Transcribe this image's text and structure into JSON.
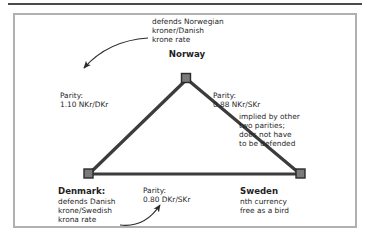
{
  "figure": {
    "type": "currency-parity-triangle",
    "nodes": [
      {
        "id": "norway",
        "label": "Norway",
        "role": "apex",
        "x": 186,
        "y": 78
      },
      {
        "id": "denmark",
        "label": "Denmark:",
        "role": "bottom-left",
        "x": 88,
        "y": 173
      },
      {
        "id": "sweden",
        "label": "Sweden",
        "role": "bottom-right",
        "x": 300,
        "y": 173
      }
    ],
    "edges": [
      {
        "id": "norway-denmark",
        "from": "norway",
        "to": "denmark",
        "parity_label": "Parity:",
        "parity_value": "1.10 NKr/DKr"
      },
      {
        "id": "norway-sweden",
        "from": "norway",
        "to": "sweden",
        "parity_label": "Parity:",
        "parity_value": "0.88 NKr/SKr"
      },
      {
        "id": "denmark-sweden",
        "from": "denmark",
        "to": "sweden",
        "parity_label": "Parity:",
        "parity_value": "0.80 DKr/SKr"
      }
    ],
    "colors": {
      "line": "#3c3c3c",
      "node_fill": "#7a7a7a",
      "node_border": "#2b2b2b",
      "frame": "#b0b0b0",
      "rule": "#4a4a4a",
      "text": "#1f1f1f",
      "background": "#ffffff"
    }
  },
  "annotations": {
    "norway_defends": "defends Norwegian\nkroner/Danish\nkrone rate",
    "implied_note": "implied by other\ntwo parities;\ndoes not have\nto be defended",
    "denmark_defends": "defends Danish\nkrone/Swedish\nkrona rate",
    "sweden_note": "nth currency\nfree as a bird"
  },
  "labels": {
    "norway_name": "Norway",
    "denmark_name": "Denmark:",
    "sweden_name": "Sweden",
    "parity_left_text": "Parity:\n1.10 NKr/DKr",
    "parity_right_text": "Parity:\n0.88 NKr/SKr",
    "parity_bottom_text": "Parity:\n0.80 DKr/SKr"
  },
  "arrows": [
    {
      "id": "arrow-to-denmark-edge",
      "from": "norway_defends_text",
      "direction": "down-left",
      "description": "curved arrow pointing from the defends-Norwegian note toward the Norway-Denmark edge"
    },
    {
      "id": "arrow-to-bottom-parity",
      "from": "denmark_defends_text",
      "direction": "up-right",
      "description": "curved arrow pointing from the Denmark note toward the 0.80 DKr/SKr parity label"
    }
  ]
}
